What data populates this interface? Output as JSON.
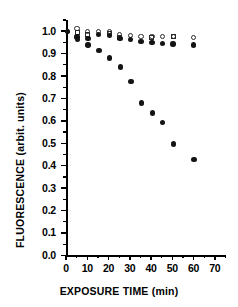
{
  "chart_data": {
    "type": "scatter",
    "title": "",
    "xlabel": "EXPOSURE TIME (min)",
    "ylabel": "FLUORESCENCE  (arbit.  units)",
    "xlim": [
      0,
      75
    ],
    "ylim": [
      0.0,
      1.05
    ],
    "grid": false,
    "legend": "none",
    "xticks": [
      0,
      10,
      20,
      30,
      40,
      50,
      60,
      70
    ],
    "xtick_labels": [
      "0",
      "10",
      "20",
      "30",
      "40",
      "50",
      "60",
      "70"
    ],
    "xticks_minor": [
      5,
      15,
      25,
      35,
      45,
      55,
      65,
      75
    ],
    "yticks": [
      0.0,
      0.1,
      0.2,
      0.3,
      0.4,
      0.5,
      0.6,
      0.7,
      0.8,
      0.9,
      1.0
    ],
    "ytick_labels": [
      "0.0",
      "0.1",
      "0.2",
      "0.3",
      "0.4",
      "0.5",
      "0.6",
      "0.7",
      "0.8",
      "0.9",
      "1.0"
    ],
    "yticks_minor": [
      0.05,
      0.15,
      0.25,
      0.35,
      0.45,
      0.55,
      0.65,
      0.75,
      0.85,
      0.95,
      1.05
    ],
    "series": [
      {
        "name": "open-circle-series",
        "marker": "open-circle",
        "color": "#2a2a2a",
        "points": [
          {
            "x": 0.6,
            "y": 1.0
          },
          {
            "x": 5.2,
            "y": 1.013
          },
          {
            "x": 10.3,
            "y": 0.997
          },
          {
            "x": 15.4,
            "y": 0.998
          },
          {
            "x": 20.4,
            "y": 1.0
          },
          {
            "x": 25.3,
            "y": 0.987
          },
          {
            "x": 30.3,
            "y": 0.98
          },
          {
            "x": 35.3,
            "y": 0.978
          },
          {
            "x": 40.4,
            "y": 0.976
          },
          {
            "x": 45.3,
            "y": 0.975
          },
          {
            "x": 50.4,
            "y": 0.978
          },
          {
            "x": 60.0,
            "y": 0.972
          }
        ]
      },
      {
        "name": "open-square-series",
        "marker": "open-square",
        "color": "#2a2a2a",
        "points": [
          {
            "x": 5.2,
            "y": 0.993
          },
          {
            "x": 10.3,
            "y": 0.986
          },
          {
            "x": 20.4,
            "y": 0.99
          },
          {
            "x": 25.3,
            "y": 0.973
          },
          {
            "x": 40.4,
            "y": 0.97
          },
          {
            "x": 50.4,
            "y": 0.975
          }
        ]
      },
      {
        "name": "filled-circle-series",
        "marker": "filled-circle",
        "color": "#141414",
        "points": [
          {
            "x": 0.6,
            "y": 0.998
          },
          {
            "x": 5.2,
            "y": 0.975
          },
          {
            "x": 5.4,
            "y": 0.963
          },
          {
            "x": 10.3,
            "y": 0.968
          },
          {
            "x": 10.4,
            "y": 0.938
          },
          {
            "x": 15.4,
            "y": 0.985
          },
          {
            "x": 15.5,
            "y": 0.915
          },
          {
            "x": 20.4,
            "y": 0.98
          },
          {
            "x": 20.5,
            "y": 0.88
          },
          {
            "x": 25.3,
            "y": 0.967
          },
          {
            "x": 25.5,
            "y": 0.84
          },
          {
            "x": 30.3,
            "y": 0.962
          },
          {
            "x": 30.5,
            "y": 0.775
          },
          {
            "x": 35.3,
            "y": 0.955
          },
          {
            "x": 35.5,
            "y": 0.68
          },
          {
            "x": 40.4,
            "y": 0.95
          },
          {
            "x": 40.6,
            "y": 0.636
          },
          {
            "x": 45.3,
            "y": 0.945
          },
          {
            "x": 45.5,
            "y": 0.592
          },
          {
            "x": 50.4,
            "y": 0.943
          },
          {
            "x": 50.6,
            "y": 0.497
          },
          {
            "x": 60.0,
            "y": 0.938
          },
          {
            "x": 60.2,
            "y": 0.428
          }
        ]
      }
    ]
  }
}
